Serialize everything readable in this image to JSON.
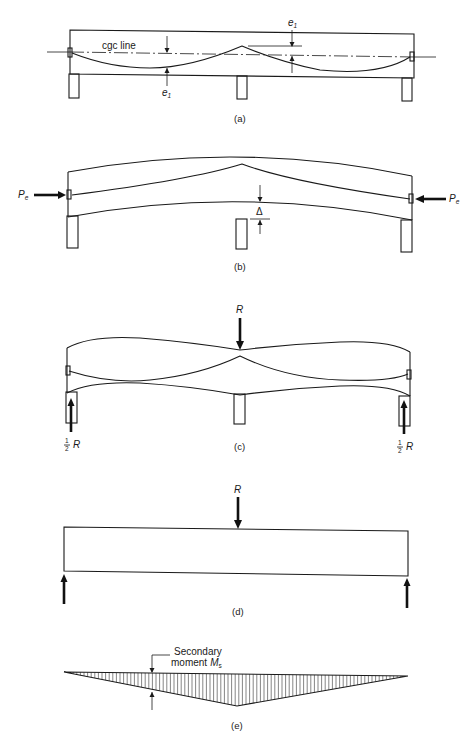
{
  "panels": {
    "a": {
      "caption": "(a)",
      "cgc_label": "cgc line",
      "eccentricity_label": "e",
      "eccentricity_sub": "1"
    },
    "b": {
      "caption": "(b)",
      "force_label": "P",
      "force_sub": "e",
      "deflection_label": "Δ"
    },
    "c": {
      "caption": "(c)",
      "reaction_label": "R",
      "half_num": "1",
      "half_den": "2",
      "half_reaction_label": "R"
    },
    "d": {
      "caption": "(d)",
      "reaction_label": "R"
    },
    "e": {
      "caption": "(e)",
      "moment_line1": "Secondary",
      "moment_line2": "moment",
      "moment_symbol": "M",
      "moment_sub": "s"
    }
  },
  "colors": {
    "ink": "#1a1a1a",
    "background": "#ffffff"
  }
}
